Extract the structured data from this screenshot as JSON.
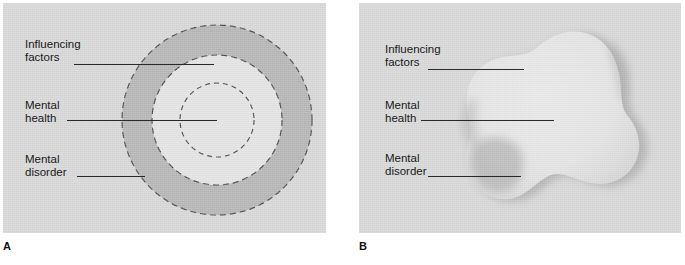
{
  "figure": {
    "panels": [
      {
        "letter": "A",
        "type": "concentric-circles",
        "labels": {
          "influencing_factors": "Influencing\nfactors",
          "influencing_factors_line1": "Influencing",
          "influencing_factors_line2": "factors",
          "mental_health_line1": "Mental",
          "mental_health_line2": "health",
          "mental_disorder_line1": "Mental",
          "mental_disorder_line2": "disorder"
        }
      },
      {
        "letter": "B",
        "type": "irregular-blob",
        "labels": {
          "influencing_factors_line1": "Influencing",
          "influencing_factors_line2": "factors",
          "mental_health_line1": "Mental",
          "mental_health_line2": "health",
          "mental_disorder_line1": "Mental",
          "mental_disorder_line2": "disorder"
        }
      }
    ],
    "colors": {
      "panel_background": "#d6d6d6",
      "outer_ring_fill": "#b4b4b4",
      "inner_disk_fill": "#e2e2e2",
      "core_fill": "#e2e2e2",
      "dash_stroke": "#4a4a4a",
      "blob_fill": "#e4e4e4",
      "blob_shadow": "#a8a8a8",
      "leader_line": "#2a2a2a",
      "text": "#1a1a1a",
      "page_background": "#ffffff"
    },
    "geometry": {
      "panel_a": {
        "x": 3,
        "y": 3,
        "width": 323,
        "height": 230
      },
      "panel_b": {
        "x": 359,
        "y": 3,
        "width": 322,
        "height": 230
      },
      "circle_center": {
        "x": 217,
        "y": 120
      },
      "outer_radius": 95,
      "middle_radius": 65,
      "core_radius": 37
    }
  }
}
